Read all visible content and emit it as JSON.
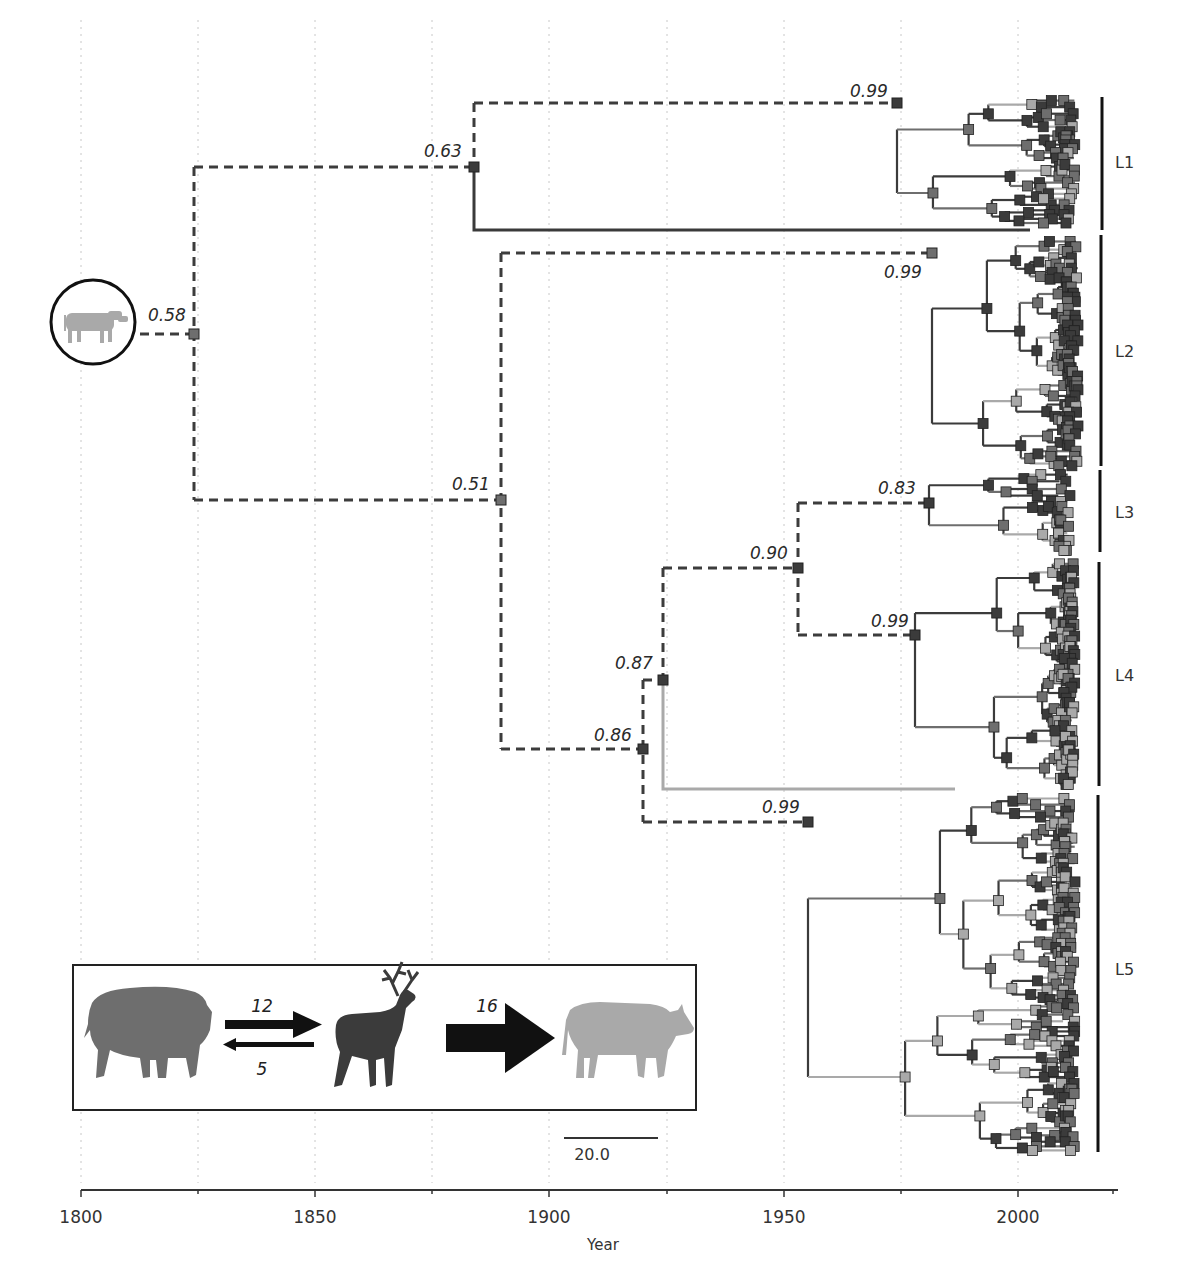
{
  "chart_data": {
    "type": "tree",
    "title": "",
    "xlabel": "Year",
    "ylabel": "",
    "xlim": [
      1800,
      2025
    ],
    "x_ticks": [
      1800,
      1850,
      1900,
      1950,
      2000
    ],
    "minor_ticks": [
      1825,
      1875,
      1925,
      1975
    ],
    "grid": "vertical dotted every 25 years",
    "scale_bar": {
      "label": "20.0",
      "years": 20
    },
    "root_host_icon": "cattle-silhouette-circled",
    "node_supports": [
      {
        "id": "root",
        "year": 1824,
        "label": "0.58"
      },
      {
        "id": "n063",
        "year": 1883,
        "label": "0.63"
      },
      {
        "id": "n099_L1",
        "year": 1975,
        "label": "0.99"
      },
      {
        "id": "n051",
        "year": 1889,
        "label": "0.51"
      },
      {
        "id": "n099_L2",
        "year": 1982,
        "label": "0.99"
      },
      {
        "id": "n086",
        "year": 1919,
        "label": "0.86"
      },
      {
        "id": "n087",
        "year": 1924,
        "label": "0.87"
      },
      {
        "id": "n090",
        "year": 1953,
        "label": "0.90"
      },
      {
        "id": "n083",
        "year": 1981,
        "label": "0.83"
      },
      {
        "id": "n099_L4",
        "year": 1978,
        "label": "0.99"
      },
      {
        "id": "n099_L5",
        "year": 1955,
        "label": "0.99"
      }
    ],
    "clades": [
      {
        "name": "L1",
        "y_top": 97,
        "y_bottom": 230
      },
      {
        "name": "L2",
        "y_top": 235,
        "y_bottom": 466
      },
      {
        "name": "L3",
        "y_top": 470,
        "y_bottom": 552
      },
      {
        "name": "L4",
        "y_top": 562,
        "y_bottom": 786
      },
      {
        "name": "L5",
        "y_top": 795,
        "y_bottom": 1152
      }
    ],
    "host_colors": {
      "bison": "#6e6e6e",
      "elk": "#3b3b3b",
      "cattle": "#a9a9a9"
    },
    "transitions": [
      {
        "from": "bison",
        "to": "elk",
        "count": 12
      },
      {
        "from": "elk",
        "to": "bison",
        "count": 5
      },
      {
        "from": "elk",
        "to": "cattle",
        "count": 16
      }
    ]
  },
  "axis": {
    "title": "Year",
    "ticks": [
      "1800",
      "1850",
      "1900",
      "1950",
      "2000"
    ]
  },
  "supports": {
    "root": "0.58",
    "n063": "0.63",
    "n099a": "0.99",
    "n051": "0.51",
    "n099b": "0.99",
    "n086": "0.86",
    "n087": "0.87",
    "n090": "0.90",
    "n083": "0.83",
    "n099c": "0.99",
    "n099d": "0.99"
  },
  "clade_labels": [
    "L1",
    "L2",
    "L3",
    "L4",
    "L5"
  ],
  "legend": {
    "bison_to_elk": "12",
    "elk_to_bison": "5",
    "elk_to_cattle": "16"
  },
  "scale_bar": "20.0"
}
